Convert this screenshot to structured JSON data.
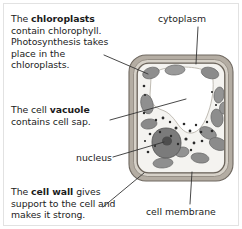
{
  "page": {
    "background_color": "#ffffff",
    "text_color": "#1b1b1b",
    "border_color": "#e2e2e2"
  },
  "notes": {
    "chloroplasts": {
      "lead": "The ",
      "term": "chloroplasts",
      "rest": " contain chlorophyll. Photosynthesis takes place in the chloroplasts."
    },
    "vacuole": {
      "lead": "The cell ",
      "term": "vacuole",
      "rest": " contains cell sap."
    },
    "cell_wall": {
      "lead": "The ",
      "term": "cell wall",
      "rest": " gives support to the cell and makes it strong."
    }
  },
  "callouts": {
    "cytoplasm": "cytoplasm",
    "nucleus": "nucleus",
    "cell_membrane": "cell membrane"
  },
  "diagram": {
    "name": "plant-cell",
    "colors": {
      "cell_wall": "#8a8279",
      "cell_wall_inner": "#bdb6ad",
      "cytoplasm": "#f3f2ef",
      "vacuole": "#ffffff",
      "chloroplast": "#8d8d8d",
      "nucleus": "#6e6e6e",
      "nucleolus": "#4a4a4a",
      "leader_line": "#3a3a3a",
      "granule": "#2d2d2d"
    },
    "parts": [
      "cell wall",
      "cell membrane",
      "cytoplasm",
      "vacuole",
      "chloroplasts",
      "nucleus",
      "nucleolus",
      "granules"
    ]
  }
}
